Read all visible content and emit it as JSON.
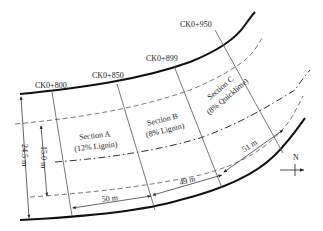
{
  "stations": [
    {
      "label": "CK0+800"
    },
    {
      "label": "CK0+850"
    },
    {
      "label": "CK0+899"
    },
    {
      "label": "CK0+950"
    }
  ],
  "sections": [
    {
      "name": "Section A",
      "treatment": "(12% Lignin)"
    },
    {
      "name": "Section B",
      "treatment": "(8% Lignin)"
    },
    {
      "name": "Section C",
      "treatment": "(8% Quicklime)"
    }
  ],
  "dimensions": {
    "total_width": "24.5 m",
    "inner_width": "15.0 m",
    "length_a": "50 m",
    "length_b": "49 m",
    "length_c": "51 m"
  },
  "compass": {
    "label": "N"
  },
  "colors": {
    "line": "#222222",
    "thin": "#555555"
  }
}
